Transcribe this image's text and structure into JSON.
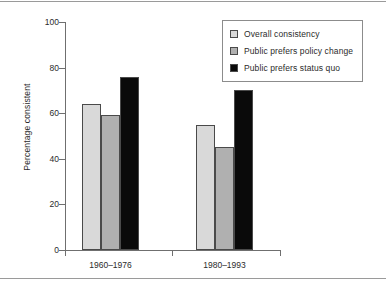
{
  "chart_data": {
    "type": "bar",
    "title": "",
    "xlabel": "",
    "ylabel": "Percentage consistent",
    "ylim": [
      0,
      100
    ],
    "yticks": [
      0,
      20,
      40,
      60,
      80,
      100
    ],
    "ytick_labels": [
      "0",
      "20",
      "40",
      "60",
      "80",
      "100"
    ],
    "grid": false,
    "legend_position": "top-right",
    "categories": [
      "1960–1976",
      "1980–1993"
    ],
    "series": [
      {
        "name": "Overall consistency",
        "color": "#d9d9d9",
        "values": [
          64,
          55
        ]
      },
      {
        "name": "Public prefers policy change",
        "color": "#b0b0b0",
        "values": [
          59,
          45
        ]
      },
      {
        "name": "Public prefers status quo",
        "color": "#0a0a0a",
        "values": [
          76,
          70
        ]
      }
    ]
  },
  "legend": {
    "items": [
      {
        "label": "Overall consistency",
        "swatch": "#d9d9d9"
      },
      {
        "label": "Public prefers policy change",
        "swatch": "#b0b0b0"
      },
      {
        "label": "Public prefers status quo",
        "swatch": "#0a0a0a"
      }
    ]
  },
  "colors": {
    "axis": "#6f6f6f",
    "bar_outline": "#4a4a4a",
    "text": "#2b2b2b",
    "rule": "#9a9a9a",
    "background": "#ffffff"
  }
}
